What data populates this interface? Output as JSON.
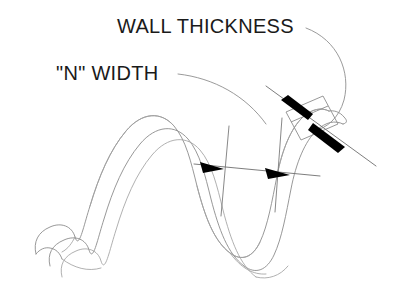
{
  "diagram": {
    "background_color": "#ffffff",
    "width": 397,
    "height": 292,
    "line_color": "#8c8c8c",
    "arrow_color": "#000000",
    "text_color": "#1a1a1a",
    "labels": [
      {
        "id": "wall-thickness",
        "text": "WALL THICKNESS",
        "x": 117,
        "y": 33,
        "font_size": 20
      },
      {
        "id": "n-width",
        "text": "\"N\" WIDTH",
        "x": 56,
        "y": 80,
        "font_size": 20
      }
    ],
    "callouts": [
      {
        "id": "wall-thickness-callout",
        "label": "WALL THICKNESS",
        "leader_type": "curved-arc",
        "arrow_style": "opposing-tapered",
        "target": "strip cross-section parallelogram"
      },
      {
        "id": "n-width-callout",
        "label": "\"N\" WIDTH",
        "leader_type": "curved-arc",
        "arrow_style": "inward-triangles",
        "target": "strip width between extension lines"
      }
    ],
    "geometry": {
      "strip_outer_edge": "M 36,253 C 34,241 39,233 50,228 C 61,223 71,227 74,237 C 78,249 82,229 88,209 C 96,181 107,154 122,135 C 138,115 158,113 172,127 C 185,140 190,163 196,186 C 204,216 213,240 229,252 C 241,261 252,257 259,243 C 267,227 272,203 277,178 C 282,152 290,130 302,118 C 311,109 322,107 330,112",
      "strip_inner_edge": "M 62,276 C 60,265 65,257 76,252 C 87,247 97,251 100,261 C 104,273 108,253 114,233 C 122,205 133,178 148,159 C 164,139 184,137 198,151 C 211,164 216,187 222,210 C 230,240 239,264 255,276",
      "strip_back_edge_1": "M 50,266 C 48,255 53,247 64,242 C 75,237 85,241 88,251 C 92,263 96,243 102,223 C 110,195 121,168 136,149 C 152,129 172,127 186,141 C 199,154 204,177 210,200 C 218,230 227,254 243,266 C 255,275 266,271 273,257 C 281,241 286,217 291,192 C 296,166 304,144 316,132 C 325,123 336,121 344,126",
      "strip_crest_1": "M 88,209 C 96,181 107,154 122,135 C 138,115 158,113 172,127",
      "strip_valley_1": "M 196,186 C 204,216 213,240 229,252 C 241,261 252,257 259,243"
    },
    "dimension_lines": {
      "n_width": {
        "start": [
          195,
          166
        ],
        "end": [
          320,
          178
        ],
        "extension_left": [
          [
            228,
            128
          ],
          [
            222,
            215
          ]
        ],
        "extension_right": [
          [
            281,
            120
          ],
          [
            276,
            210
          ]
        ]
      },
      "wall_thickness": {
        "start": [
          268,
          88
        ],
        "end": [
          376,
          166
        ],
        "angle_deg": 36
      }
    }
  }
}
